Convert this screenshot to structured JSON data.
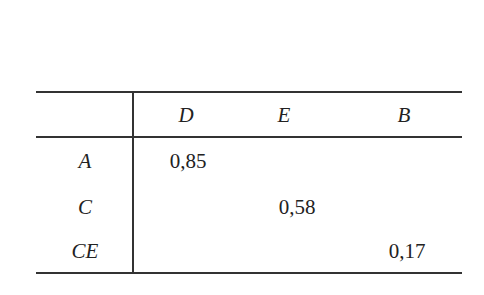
{
  "table": {
    "columns": [
      "D",
      "E",
      "B"
    ],
    "rows": [
      {
        "label": "A",
        "values": [
          "0,85",
          "",
          ""
        ]
      },
      {
        "label": "C",
        "values": [
          "",
          "0,58",
          ""
        ]
      },
      {
        "label": "CE",
        "values": [
          "",
          "",
          "0,17"
        ]
      }
    ]
  }
}
